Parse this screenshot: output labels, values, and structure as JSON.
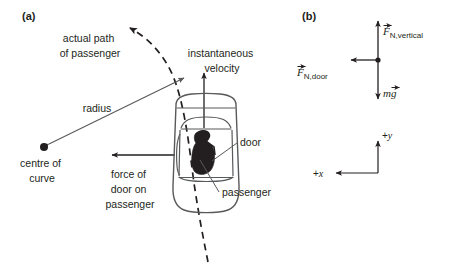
{
  "figure": {
    "background": "#ffffff",
    "ink": "#231f20",
    "line": "#58595b",
    "width": 450,
    "height": 270
  },
  "panels": [
    {
      "id": "panel-a",
      "label": "(a)",
      "label_pos": {
        "x": 22,
        "y": 20
      },
      "annotations": [
        {
          "name": "actual-path-of-passenger",
          "lines": [
            "actual path",
            "of passenger"
          ],
          "x": 90,
          "y": 42,
          "anchor": "middle",
          "line_height": 15
        },
        {
          "name": "instantaneous-velocity",
          "lines": [
            "instantaneous",
            "velocity"
          ],
          "x": 222,
          "y": 57,
          "anchor": "middle",
          "line_height": 15
        },
        {
          "name": "radius",
          "lines": [
            "radius"
          ],
          "x": 97,
          "y": 112,
          "anchor": "middle",
          "line_height": 15
        },
        {
          "name": "centre-of-curve",
          "lines": [
            "centre of",
            "curve"
          ],
          "x": 42,
          "y": 167,
          "anchor": "middle",
          "line_height": 15
        },
        {
          "name": "force-of-door-on-passenger",
          "lines": [
            "force of",
            "door on",
            "passenger"
          ],
          "x": 130,
          "y": 178,
          "anchor": "middle",
          "line_height": 15
        },
        {
          "name": "door",
          "lines": [
            "door"
          ],
          "x": 240,
          "y": 146,
          "anchor": "start",
          "line_height": 15
        },
        {
          "name": "passenger",
          "lines": [
            "passenger"
          ],
          "x": 222,
          "y": 196,
          "anchor": "start",
          "line_height": 15
        }
      ]
    },
    {
      "id": "panel-b",
      "label": "(b)",
      "label_pos": {
        "x": 302,
        "y": 20
      },
      "forces": [
        {
          "name": "normal-force-vertical",
          "symbol": "F",
          "subscript": "N,vertical",
          "direction": "up",
          "label_x": 383,
          "label_y": 35
        },
        {
          "name": "normal-force-door",
          "symbol": "F",
          "subscript": "N,door",
          "direction": "left",
          "label_x": 297,
          "label_y": 76
        },
        {
          "name": "weight",
          "symbol": "mg",
          "subscript": "",
          "direction": "down",
          "label_x": 383,
          "label_y": 97
        }
      ],
      "axes": [
        {
          "name": "axis-plus-y",
          "label": "+y",
          "x": 382,
          "y": 139
        },
        {
          "name": "axis-plus-x",
          "label": "+x",
          "x": 313,
          "y": 177
        }
      ]
    }
  ]
}
